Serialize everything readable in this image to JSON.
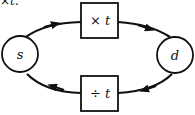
{
  "caption_fragment": "×t.",
  "nodes": {
    "source": {
      "label": "s",
      "shape": "circle"
    },
    "dest": {
      "label": "d",
      "shape": "circle"
    },
    "multiply": {
      "label": "× t",
      "shape": "box"
    },
    "divide": {
      "label": "÷ t",
      "shape": "box"
    }
  },
  "edges": [
    {
      "from": "s",
      "to": "× t"
    },
    {
      "from": "× t",
      "to": "d"
    },
    {
      "from": "d",
      "to": "÷ t"
    },
    {
      "from": "÷ t",
      "to": "s"
    }
  ],
  "colors": {
    "stroke": "#111111",
    "background": "#ffffff"
  }
}
